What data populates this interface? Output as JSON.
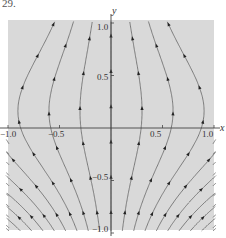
{
  "figure": {
    "problem_number": "29.",
    "x_axis_label": "x",
    "y_axis_label": "y",
    "x_tick_labels": [
      "−1.0",
      "−0.5",
      "0.5",
      "1.0"
    ],
    "y_tick_labels": [
      "1.0",
      "0.5",
      "−0.5",
      "−1.0"
    ],
    "x_range": [
      -1.0,
      1.0
    ],
    "y_range": [
      -1.0,
      1.0
    ],
    "background_color": "#d9d9d9",
    "line_color": "#555555",
    "arrow_color": "#222222"
  },
  "chart_data": {
    "type": "streamplot",
    "title": "",
    "xlabel": "x",
    "ylabel": "y",
    "xlim": [
      -1.0,
      1.0
    ],
    "ylim": [
      -1.0,
      1.0
    ],
    "xticks": [
      -1.0,
      -0.5,
      0.5,
      1.0
    ],
    "yticks": [
      -1.0,
      -0.5,
      0.5,
      1.0
    ],
    "grid": false
  }
}
